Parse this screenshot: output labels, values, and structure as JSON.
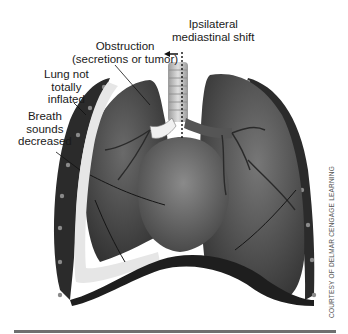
{
  "figure": {
    "labels": {
      "mediastinal_shift": [
        "Ipsilateral",
        "mediastinal shift"
      ],
      "obstruction": [
        "Obstruction",
        "(secretions or tumor)"
      ],
      "lung_not_inflated": [
        "Lung not",
        "totally",
        "inflated"
      ],
      "breath_sounds": [
        "Breath",
        "sounds",
        "decreased"
      ]
    },
    "credit": "COURTESY OF DELMAR CENGAGE LEARNING",
    "colors": {
      "background": "#ffffff",
      "lung_dark": "#3a3a3a",
      "lung_mid": "#5c5c5c",
      "ribs": "#2b2b2b",
      "pleura_highlight": "#e6e6e6",
      "divider": "#6f6f6f"
    }
  }
}
